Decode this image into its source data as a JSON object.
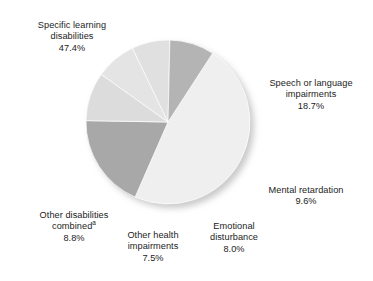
{
  "figure": {
    "background_color": "#ffffff",
    "text_color": "#1c1c1c",
    "shadow_color": "#c9c9c9"
  },
  "chart_data": {
    "type": "pie",
    "title": "",
    "subtitle": "",
    "xlabel": "",
    "ylabel": "",
    "legend_position": "none",
    "grid": false,
    "center": {
      "x": 168,
      "y": 122
    },
    "radius": 82,
    "start_angle_deg": 33,
    "direction": "clockwise",
    "labels": [
      "Specific learning disabilities",
      "Speech or language impairments",
      "Mental retardation",
      "Emotional disturbance",
      "Other health impairments",
      "Other disabilities combined"
    ],
    "values": [
      47.4,
      18.7,
      9.6,
      8.0,
      7.5,
      8.8
    ],
    "value_labels": [
      "47.4%",
      "18.7%",
      "9.6%",
      "8.0%",
      "7.5%",
      "8.8%"
    ],
    "colors": [
      "#efefef",
      "#a8a8a8",
      "#dcdcdc",
      "#e4e4e4",
      "#e0e0e0",
      "#b4b4b4"
    ],
    "slice_edge_color": "#ffffff",
    "annotations": [
      "a"
    ],
    "slices": [
      {
        "name": "specific-learning-disabilities",
        "label_line1": "Specific learning",
        "label_line2": "disabilities",
        "value_label": "47.4%",
        "value": 47.4,
        "color": "#efefef",
        "footnote_marker": ""
      },
      {
        "name": "speech-or-language-impairments",
        "label_line1": "Speech or language",
        "label_line2": "impairments",
        "value_label": "18.7%",
        "value": 18.7,
        "color": "#a8a8a8",
        "footnote_marker": ""
      },
      {
        "name": "mental-retardation",
        "label_line1": "Mental retardation",
        "label_line2": "",
        "value_label": "9.6%",
        "value": 9.6,
        "color": "#dcdcdc",
        "footnote_marker": ""
      },
      {
        "name": "emotional-disturbance",
        "label_line1": "Emotional",
        "label_line2": "disturbance",
        "value_label": "8.0%",
        "value": 8.0,
        "color": "#e4e4e4",
        "footnote_marker": ""
      },
      {
        "name": "other-health-impairments",
        "label_line1": "Other health",
        "label_line2": "impairments",
        "value_label": "7.5%",
        "value": 7.5,
        "color": "#e0e0e0",
        "footnote_marker": ""
      },
      {
        "name": "other-disabilities-combined",
        "label_line1": "Other disabilities",
        "label_line2": "combined",
        "value_label": "8.8%",
        "value": 8.8,
        "color": "#b4b4b4",
        "footnote_marker": "a"
      }
    ]
  }
}
